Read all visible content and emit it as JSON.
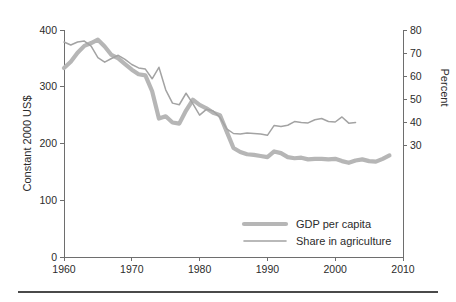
{
  "chart_data": {
    "type": "line",
    "title": "",
    "subtitle": "",
    "xlabel": "",
    "ylabel": "Constant 2000 US$",
    "y2label": "Percent",
    "xlim": [
      1960,
      2010
    ],
    "ylim": [
      0,
      400
    ],
    "y2lim": [
      25,
      80
    ],
    "grid": false,
    "legend_position": "bottom-right",
    "x_ticks": [
      "1960",
      "1970",
      "1980",
      "1990",
      "2000",
      "2010"
    ],
    "x_tick_values": [
      1960,
      1970,
      1980,
      1990,
      2000,
      2010
    ],
    "y_ticks": [
      "0",
      "100",
      "200",
      "300",
      "400"
    ],
    "y_tick_values": [
      0,
      100,
      200,
      300,
      400
    ],
    "y2_ticks": [
      "30",
      "40",
      "50",
      "60",
      "70",
      "80"
    ],
    "y2_tick_values": [
      30,
      40,
      50,
      60,
      70,
      80
    ],
    "colors": {
      "gdp_per_capita": "#b6b6b6",
      "share_in_agriculture": "#a3a3a3",
      "axis": "#6e6e6e",
      "text": "#2b2b2b",
      "background": "#ffffff",
      "footer_rule": "#4a4a4a"
    },
    "series": [
      {
        "name": "GDP per capita",
        "axis": "left",
        "unit": "Constant 2000 US$",
        "stroke_width": 4.2,
        "x": [
          1960,
          1961,
          1962,
          1963,
          1964,
          1965,
          1966,
          1967,
          1968,
          1969,
          1970,
          1971,
          1972,
          1973,
          1974,
          1975,
          1976,
          1977,
          1978,
          1979,
          1980,
          1981,
          1982,
          1983,
          1984,
          1985,
          1986,
          1987,
          1988,
          1989,
          1990,
          1991,
          1992,
          1993,
          1994,
          1995,
          1996,
          1997,
          1998,
          1999,
          2000,
          2001,
          2002,
          2003,
          2004,
          2005,
          2006,
          2007,
          2008
        ],
        "values": [
          333,
          344,
          360,
          372,
          377,
          383,
          371,
          356,
          350,
          340,
          330,
          322,
          320,
          292,
          244,
          248,
          237,
          235,
          258,
          277,
          268,
          262,
          254,
          250,
          221,
          192,
          185,
          181,
          180,
          178,
          176,
          186,
          183,
          176,
          174,
          175,
          172,
          173,
          173,
          172,
          173,
          169,
          166,
          170,
          172,
          169,
          168,
          173,
          179
        ]
      },
      {
        "name": "Share in agriculture",
        "axis": "right",
        "unit": "Percent",
        "stroke_width": 1.5,
        "x": [
          1960,
          1961,
          1962,
          1963,
          1964,
          1965,
          1966,
          1967,
          1968,
          1969,
          1970,
          1971,
          1972,
          1973,
          1974,
          1975,
          1976,
          1977,
          1978,
          1979,
          1980,
          1981,
          1982,
          1983,
          1984,
          1985,
          1986,
          1987,
          1988,
          1989,
          1990,
          1991,
          1992,
          1993,
          1994,
          1995,
          1996,
          1997,
          1998,
          1999,
          2000,
          2001,
          2002,
          2003
        ],
        "values": [
          74.8,
          73.5,
          74.8,
          75.2,
          73.0,
          68.0,
          66.0,
          67.6,
          69.0,
          67.2,
          65.0,
          63.5,
          63.0,
          58.8,
          63.8,
          54.0,
          48.2,
          47.5,
          52.5,
          48.0,
          43.0,
          45.5,
          44.8,
          42.0,
          37.0,
          35.0,
          34.8,
          35.2,
          35.0,
          34.8,
          34.2,
          38.5,
          38.0,
          38.6,
          40.2,
          39.8,
          39.6,
          41.0,
          41.5,
          40.2,
          40.0,
          42.2,
          39.5,
          39.8
        ]
      }
    ],
    "legend": [
      {
        "label": "GDP per capita",
        "color": "#b6b6b6",
        "style": "thick"
      },
      {
        "label": "Share in agriculture",
        "color": "#a3a3a3",
        "style": "thin"
      }
    ]
  }
}
